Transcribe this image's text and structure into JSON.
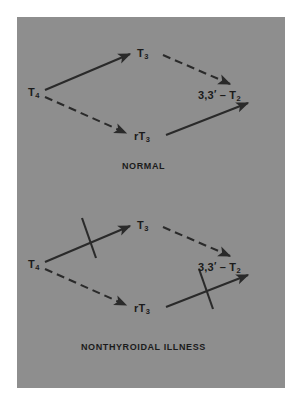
{
  "figure": {
    "background_color": "#ffffff",
    "panel_color": "#8e8e8e",
    "ink_color": "#1b1b1b"
  },
  "diagrams": [
    {
      "id": "normal",
      "caption": "NORMAL",
      "nodes": [
        {
          "id": "t4",
          "label_main": "T",
          "label_sub": "4",
          "label_text": "T4"
        },
        {
          "id": "t3",
          "label_main": "T",
          "label_sub": "3",
          "label_text": "T3"
        },
        {
          "id": "rt3",
          "label_main": "rT",
          "label_sub": "3",
          "label_text": "rT3"
        },
        {
          "id": "t2",
          "label_prefix": "3,3",
          "label_prime": "′",
          "label_dash": " – T",
          "label_sub": "2",
          "label_text": "3,3′ – T2"
        }
      ],
      "edges": [
        {
          "from": "t4",
          "to": "t3",
          "style": "solid",
          "blocked": false
        },
        {
          "from": "t3",
          "to": "t2",
          "style": "dashed",
          "blocked": false
        },
        {
          "from": "t4",
          "to": "rt3",
          "style": "dashed",
          "blocked": false
        },
        {
          "from": "rt3",
          "to": "t2",
          "style": "solid",
          "blocked": false
        }
      ]
    },
    {
      "id": "nonthyroidal-illness",
      "caption": "NONTHYROIDAL ILLNESS",
      "nodes": [
        {
          "id": "t4",
          "label_main": "T",
          "label_sub": "4",
          "label_text": "T4"
        },
        {
          "id": "t3",
          "label_main": "T",
          "label_sub": "3",
          "label_text": "T3"
        },
        {
          "id": "rt3",
          "label_main": "rT",
          "label_sub": "3",
          "label_text": "rT3"
        },
        {
          "id": "t2",
          "label_prefix": "3,3",
          "label_prime": "′",
          "label_dash": " – T",
          "label_sub": "2",
          "label_text": "3,3′ – T2"
        }
      ],
      "edges": [
        {
          "from": "t4",
          "to": "t3",
          "style": "solid",
          "blocked": true
        },
        {
          "from": "t3",
          "to": "t2",
          "style": "dashed",
          "blocked": false
        },
        {
          "from": "t4",
          "to": "rt3",
          "style": "dashed",
          "blocked": false
        },
        {
          "from": "rt3",
          "to": "t2",
          "style": "solid",
          "blocked": true
        }
      ]
    }
  ]
}
